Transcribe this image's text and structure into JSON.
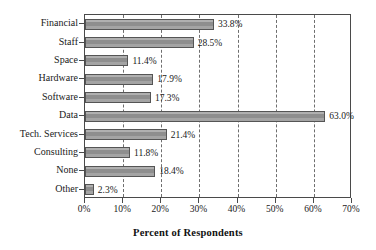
{
  "chart_data": {
    "type": "bar",
    "orientation": "horizontal",
    "title": "",
    "xlabel": "Percent of Respondents",
    "ylabel": "",
    "xlim": [
      0,
      70
    ],
    "xticks": [
      "0%",
      "10%",
      "20%",
      "30%",
      "40%",
      "50%",
      "60%",
      "70%"
    ],
    "xtick_values": [
      0,
      10,
      20,
      30,
      40,
      50,
      60,
      70
    ],
    "grid": "vertical-dashed",
    "legend": "none",
    "categories": [
      "Financial",
      "Staff",
      "Space",
      "Hardware",
      "Software",
      "Data",
      "Tech. Services",
      "Consulting",
      "None",
      "Other"
    ],
    "values": [
      33.8,
      28.5,
      11.4,
      17.9,
      17.3,
      63.0,
      21.4,
      11.8,
      18.4,
      2.3
    ],
    "value_labels": [
      "33.8%",
      "28.5%",
      "11.4%",
      "17.9%",
      "17.3%",
      "63.0%",
      "21.4%",
      "11.8%",
      "18.4%",
      "2.3%"
    ],
    "bar_color": "#9a9a9a",
    "bar_edge_color": "#555555",
    "axis_color": "#4a4a4a",
    "background": "#ffffff"
  }
}
